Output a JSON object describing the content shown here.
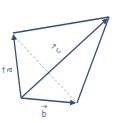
{
  "diagram": {
    "title": "",
    "colors": {
      "line": "#34507e",
      "dashed": "#9fb0c8",
      "label": "#5a6c86"
    },
    "vectors": [
      {
        "id": "a",
        "label": "a",
        "from": "O",
        "to": "A",
        "arrow": true
      },
      {
        "id": "b",
        "label": "b",
        "from": "O",
        "to": "B",
        "arrow": true
      },
      {
        "id": "c",
        "label": "c",
        "from": "O",
        "to": "C",
        "arrow": true
      }
    ],
    "segments": [
      {
        "from": "A",
        "to": "C",
        "style": "solid"
      },
      {
        "from": "B",
        "to": "C",
        "style": "solid"
      },
      {
        "from": "A",
        "to": "B",
        "style": "dashed"
      }
    ],
    "labels": {
      "a": "a",
      "b": "b",
      "c": "c",
      "vec_mark": "→"
    }
  }
}
